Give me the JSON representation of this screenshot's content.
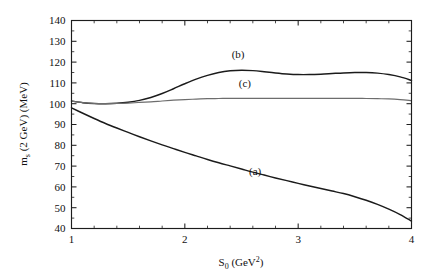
{
  "figure": {
    "background_color": "#ffffff",
    "frame_color": "#1d1d1d"
  },
  "chart_data": {
    "type": "line",
    "title": "",
    "subtitle": "",
    "xlabel": "S0 (GeV2)",
    "xlabel_base": "S",
    "xlabel_sub": "0",
    "xlabel_unit_open": " (GeV",
    "xlabel_sup": "2",
    "xlabel_unit_close": ")",
    "ylabel": "ms (2 GeV) (MeV)",
    "ylabel_base": "m",
    "ylabel_sub": "s",
    "ylabel_rest": " (2 GeV) (MeV)",
    "xlim": [
      1,
      4
    ],
    "ylim": [
      40,
      140
    ],
    "xticks": [
      1,
      2,
      3,
      4
    ],
    "xtick_labels": [
      "1",
      "2",
      "3",
      "4"
    ],
    "yticks": [
      40,
      50,
      60,
      70,
      80,
      90,
      100,
      110,
      120,
      130,
      140
    ],
    "ytick_labels": [
      "40",
      "50",
      "60",
      "70",
      "80",
      "90",
      "100",
      "110",
      "120",
      "130",
      "140"
    ],
    "x_minor_step": 0.2,
    "y_minor_step": 5,
    "grid": false,
    "legend_position": "inline-annotations",
    "annotations": [
      {
        "text": "(a)",
        "x": 2.62,
        "y": 65.5,
        "name": "curve-label-a"
      },
      {
        "text": "(b)",
        "x": 2.47,
        "y": 122.0,
        "name": "curve-label-b"
      },
      {
        "text": "(c)",
        "x": 2.53,
        "y": 108.0,
        "name": "curve-label-c"
      }
    ],
    "series": [
      {
        "name": "(a)",
        "color": "#1b1b1b",
        "width": 1.45,
        "x": [
          1.0,
          1.1,
          1.2,
          1.3,
          1.4,
          1.5,
          1.6,
          1.7,
          1.8,
          1.9,
          2.0,
          2.1,
          2.2,
          2.3,
          2.4,
          2.5,
          2.6,
          2.7,
          2.8,
          2.9,
          3.0,
          3.1,
          3.2,
          3.3,
          3.4,
          3.5,
          3.6,
          3.7,
          3.8,
          3.9,
          4.0
        ],
        "values": [
          98.0,
          95.4,
          92.9,
          90.5,
          88.3,
          86.2,
          84.1,
          82.1,
          80.2,
          78.4,
          76.6,
          74.9,
          73.2,
          71.6,
          70.1,
          68.6,
          67.1,
          65.7,
          64.3,
          63.0,
          61.7,
          60.4,
          59.2,
          58.0,
          56.8,
          55.3,
          53.6,
          51.6,
          49.3,
          46.7,
          43.6
        ]
      },
      {
        "name": "(b)",
        "color": "#1b1b1b",
        "width": 1.45,
        "x": [
          1.0,
          1.1,
          1.2,
          1.3,
          1.4,
          1.5,
          1.6,
          1.7,
          1.8,
          1.9,
          2.0,
          2.1,
          2.2,
          2.3,
          2.4,
          2.5,
          2.6,
          2.7,
          2.8,
          2.9,
          3.0,
          3.1,
          3.2,
          3.3,
          3.4,
          3.5,
          3.6,
          3.7,
          3.8,
          3.9,
          4.0
        ],
        "values": [
          101.3,
          100.5,
          100.1,
          100.0,
          100.2,
          100.7,
          101.6,
          103.0,
          104.9,
          107.2,
          109.6,
          111.8,
          113.6,
          115.0,
          115.8,
          116.1,
          115.9,
          115.4,
          114.8,
          114.3,
          114.0,
          114.0,
          114.2,
          114.5,
          114.8,
          115.0,
          115.0,
          114.7,
          114.0,
          112.9,
          111.2
        ]
      },
      {
        "name": "(c)",
        "color": "#6d6d6d",
        "width": 1.2,
        "x": [
          1.0,
          1.1,
          1.2,
          1.3,
          1.4,
          1.5,
          1.6,
          1.7,
          1.8,
          1.9,
          2.0,
          2.1,
          2.2,
          2.3,
          2.4,
          2.5,
          2.6,
          2.7,
          2.8,
          2.9,
          3.0,
          3.1,
          3.2,
          3.3,
          3.4,
          3.5,
          3.6,
          3.7,
          3.8,
          3.9,
          4.0
        ],
        "values": [
          101.2,
          100.5,
          100.1,
          100.0,
          100.1,
          100.3,
          100.6,
          100.9,
          101.3,
          101.7,
          102.0,
          102.2,
          102.4,
          102.5,
          102.6,
          102.6,
          102.6,
          102.6,
          102.6,
          102.6,
          102.6,
          102.6,
          102.6,
          102.6,
          102.6,
          102.6,
          102.5,
          102.4,
          102.3,
          102.0,
          101.5
        ]
      }
    ]
  }
}
